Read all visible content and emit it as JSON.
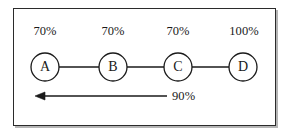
{
  "diagram": {
    "frame": {
      "border_color": "#2b2b2b",
      "background_color": "#ffffff",
      "shadow_color": "#787878"
    },
    "stroke_color": "#1a1a1a",
    "text_color": "#1a1a1a",
    "nodes": [
      {
        "id": "A",
        "label": "A",
        "percent_label": "70%",
        "cx": 45,
        "cy": 67,
        "r": 14
      },
      {
        "id": "B",
        "label": "B",
        "percent_label": "70%",
        "cx": 113,
        "cy": 67,
        "r": 14
      },
      {
        "id": "C",
        "label": "C",
        "percent_label": "70%",
        "cx": 178,
        "cy": 67,
        "r": 14
      },
      {
        "id": "D",
        "label": "D",
        "percent_label": "100%",
        "cx": 243,
        "cy": 67,
        "r": 14
      }
    ],
    "edges": [
      {
        "from": "A",
        "to": "B",
        "x1": 59,
        "y1": 67,
        "x2": 99,
        "y2": 67
      },
      {
        "from": "B",
        "to": "C",
        "x1": 127,
        "y1": 67,
        "x2": 164,
        "y2": 67
      },
      {
        "from": "C",
        "to": "D",
        "x1": 192,
        "y1": 67,
        "x2": 229,
        "y2": 67
      }
    ],
    "arrow": {
      "label": "90%",
      "direction": "left",
      "x_start": 167,
      "x_end": 35,
      "y": 96,
      "head_length": 9,
      "head_half_width": 4
    }
  }
}
